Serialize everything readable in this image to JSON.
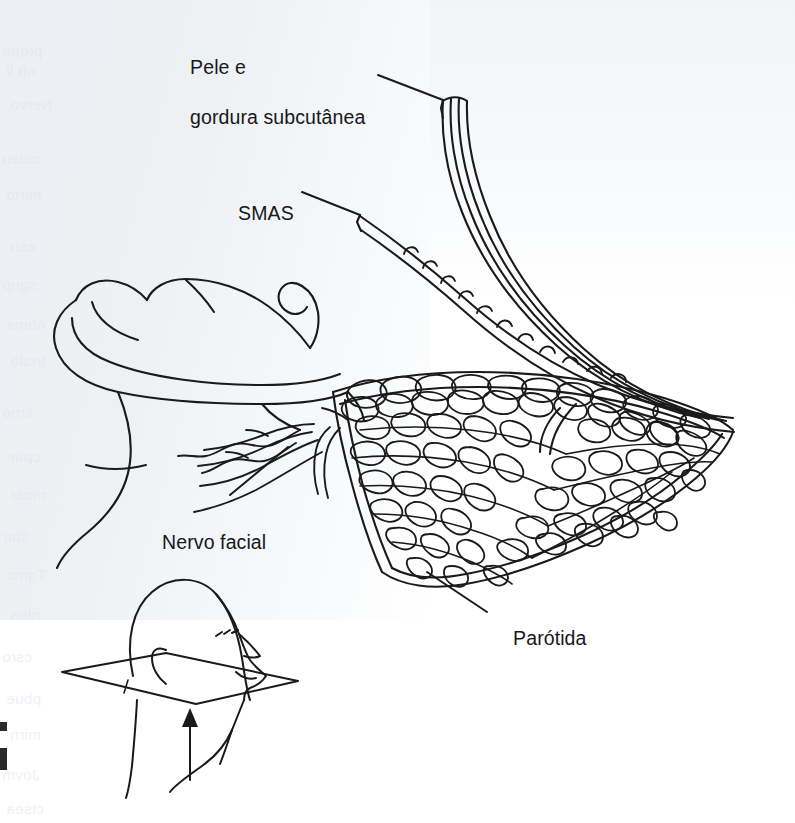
{
  "figure": {
    "language": "pt-BR",
    "style": "line drawing",
    "ink_color": "#1a1a1a",
    "background_color": "#ffffff",
    "paper_tint_color": "#eef1f4"
  },
  "labels": {
    "skin_fat": {
      "line1": "Pele e",
      "line2": "gordura subcutânea"
    },
    "smas": "SMAS",
    "facial_nerve": "Nervo facial",
    "parotid": "Parótida"
  },
  "structures": [
    {
      "name": "skin-and-subcutaneous-fat-flap",
      "label": "Pele e gordura subcutânea",
      "description": "retalho de tres linhas elevado no canto superior direito"
    },
    {
      "name": "smas-flap",
      "label": "SMAS",
      "description": "lamina fina com borda inferior recortada"
    },
    {
      "name": "parotid-gland",
      "label": "Parótida",
      "description": "glandula lobulada em mosaico"
    },
    {
      "name": "facial-nerve",
      "label": "Nervo facial",
      "description": "ramos que emergem da borda anterior da glandula"
    },
    {
      "name": "mandible-ramus",
      "label": "",
      "description": "ramo da mandibula a esquerda"
    },
    {
      "name": "orientation-inset",
      "label": "",
      "description": "cabeca em perfil com plano de corte e seta"
    }
  ],
  "inset": {
    "name": "orientation-inset",
    "plane": "plano de corte axial",
    "arrow_direction": "up",
    "arrow_meaning": "direcao do olhar"
  },
  "bleed_through": [
    {
      "top": 42,
      "text": "prqtm"
    },
    {
      "top": 62,
      "text": "nb li"
    },
    {
      "top": 96,
      "text": "Nervo"
    },
    {
      "top": 150,
      "text": "oideu"
    },
    {
      "top": 186,
      "text": "mirto"
    },
    {
      "top": 238,
      "text": "cau"
    },
    {
      "top": 276,
      "text": "sgnp"
    },
    {
      "top": 316,
      "text": "nbma"
    },
    {
      "top": 352,
      "text": "trcdo"
    },
    {
      "top": 404,
      "text": "lirno"
    },
    {
      "top": 448,
      "text": "cpue"
    },
    {
      "top": 486,
      "text": "moar"
    },
    {
      "top": 528,
      "text": "sbtr"
    },
    {
      "top": 566,
      "text": "Tgmo"
    },
    {
      "top": 606,
      "text": "nloa"
    },
    {
      "top": 648,
      "text": "csro"
    },
    {
      "top": 690,
      "text": "pbue"
    },
    {
      "top": 726,
      "text": "mirn"
    },
    {
      "top": 766,
      "text": "Jovm"
    },
    {
      "top": 800,
      "text": "ctsea"
    }
  ]
}
